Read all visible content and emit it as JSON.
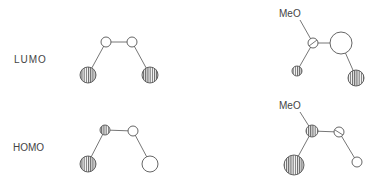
{
  "labels": {
    "lumo": "LUMO",
    "homo": "HOMO",
    "meo_lumo": "MeO",
    "meo_homo": "MeO"
  },
  "colors": {
    "line": "#666666",
    "hatch": "#666666",
    "open_fill": "#ffffff"
  },
  "diagrams": [
    {
      "name": "lumo-butadiene",
      "orbitals": [
        {
          "atom": "C1",
          "phase": "shaded",
          "size": "large"
        },
        {
          "atom": "C2",
          "phase": "open",
          "size": "small"
        },
        {
          "atom": "C3",
          "phase": "open",
          "size": "small"
        },
        {
          "atom": "C4",
          "phase": "shaded",
          "size": "large"
        }
      ]
    },
    {
      "name": "lumo-methoxy-butadiene",
      "orbitals": [
        {
          "atom": "C1",
          "phase": "shaded",
          "size": "small"
        },
        {
          "atom": "C2",
          "phase": "open",
          "size": "small"
        },
        {
          "atom": "C3",
          "phase": "open",
          "size": "large"
        },
        {
          "atom": "C4",
          "phase": "shaded",
          "size": "large"
        }
      ]
    },
    {
      "name": "homo-butadiene",
      "orbitals": [
        {
          "atom": "C1",
          "phase": "shaded",
          "size": "large"
        },
        {
          "atom": "C2",
          "phase": "shaded",
          "size": "small"
        },
        {
          "atom": "C3",
          "phase": "open",
          "size": "small"
        },
        {
          "atom": "C4",
          "phase": "open",
          "size": "large"
        }
      ]
    },
    {
      "name": "homo-methoxy-butadiene",
      "orbitals": [
        {
          "atom": "C1",
          "phase": "shaded",
          "size": "large"
        },
        {
          "atom": "C2",
          "phase": "shaded",
          "size": "small"
        },
        {
          "atom": "C3",
          "phase": "open",
          "size": "small"
        },
        {
          "atom": "C4",
          "phase": "open",
          "size": "small"
        }
      ]
    }
  ]
}
